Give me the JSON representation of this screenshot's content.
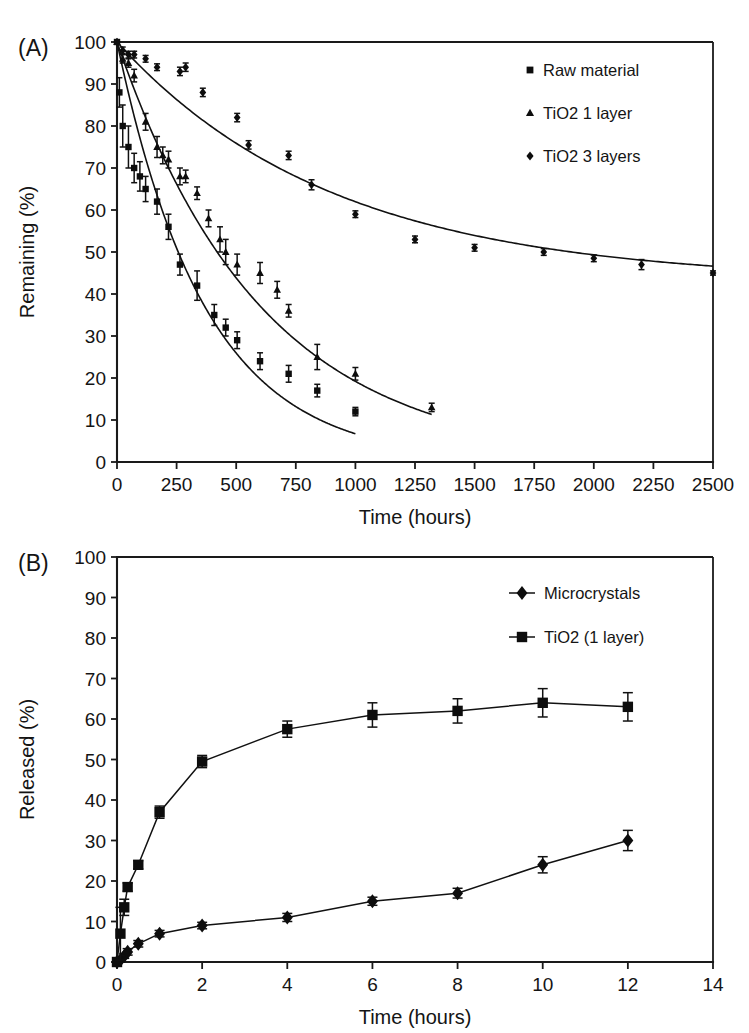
{
  "figure": {
    "background": "#ffffff",
    "ink_color": "#111111"
  },
  "panels": [
    {
      "id": "A",
      "letter": "(A)",
      "xlabel": "Time (hours)",
      "ylabel": "Remaining (%)"
    },
    {
      "id": "B",
      "letter": "(B)",
      "xlabel": "Time (hours)",
      "ylabel": "Released (%)"
    }
  ],
  "chart_data": [
    {
      "id": "panel-a",
      "type": "scatter",
      "title": "",
      "panel_label": "(A)",
      "xlabel": "Time (hours)",
      "ylabel": "Remaining (%)",
      "xlim": [
        0,
        2500
      ],
      "ylim": [
        0,
        100
      ],
      "xticks": [
        0,
        250,
        500,
        750,
        1000,
        1250,
        1500,
        1750,
        2000,
        2250,
        2500
      ],
      "xticklabels": [
        "0",
        "250",
        "500",
        "750",
        "1000",
        "1250",
        "1500",
        "1750",
        "2000",
        "2250",
        "2500"
      ],
      "yticks": [
        0,
        10,
        20,
        30,
        40,
        50,
        60,
        70,
        80,
        90,
        100
      ],
      "yticklabels": [
        "0",
        "10",
        "20",
        "30",
        "40",
        "50",
        "60",
        "70",
        "80",
        "90",
        "100"
      ],
      "grid": false,
      "legend_position": "upper-right",
      "has_fit_curves": true,
      "error_bars": "symmetric-standard-deviation",
      "series": [
        {
          "name": "Raw material",
          "marker": "square",
          "x": [
            0,
            10,
            24,
            48,
            72,
            96,
            120,
            168,
            216,
            264,
            336,
            408,
            456,
            504,
            600,
            720,
            840,
            1000
          ],
          "y": [
            100,
            88,
            80,
            75,
            70,
            68,
            65,
            62,
            56,
            47,
            42,
            35,
            32,
            29,
            24,
            21,
            17,
            12
          ],
          "yerr": [
            0.5,
            3.5,
            5.0,
            5.0,
            3.5,
            3.5,
            3.0,
            3.0,
            3.0,
            2.5,
            3.5,
            2.5,
            2.0,
            2.0,
            2.0,
            2.0,
            1.5,
            1.0
          ],
          "fit": {
            "model": "exponential-decay",
            "y0": 100,
            "plateau": 0,
            "rate_per_hour": 0.0027
          }
        },
        {
          "name": "TiO2 1 layer",
          "marker": "triangle",
          "x": [
            0,
            24,
            48,
            72,
            120,
            168,
            192,
            216,
            264,
            288,
            336,
            384,
            432,
            456,
            504,
            600,
            672,
            720,
            840,
            1000,
            1320
          ],
          "y": [
            100,
            96,
            95,
            92,
            81,
            75,
            73,
            72,
            68,
            68,
            64,
            58,
            53,
            50,
            47,
            45,
            41,
            36,
            25,
            21,
            13
          ],
          "yerr": [
            0.5,
            1.0,
            1.0,
            1.5,
            2.0,
            2.5,
            2.0,
            2.0,
            2.0,
            1.5,
            1.5,
            2.0,
            3.0,
            3.0,
            2.5,
            2.5,
            2.0,
            1.5,
            3.0,
            1.5,
            1.0
          ],
          "fit": {
            "model": "exponential-decay",
            "y0": 100,
            "plateau": 0,
            "rate_per_hour": 0.00165
          }
        },
        {
          "name": "TiO2 3 layers",
          "marker": "diamond",
          "x": [
            0,
            24,
            48,
            72,
            120,
            168,
            264,
            288,
            360,
            504,
            552,
            720,
            816,
            1000,
            1250,
            1500,
            1790,
            2000,
            2200,
            2500
          ],
          "y": [
            100,
            98,
            97,
            97,
            96,
            94,
            93,
            94,
            88,
            82,
            75.5,
            73,
            66,
            59,
            53,
            51,
            50,
            48.5,
            47,
            45
          ],
          "yerr": [
            0.5,
            0.8,
            0.8,
            0.8,
            0.8,
            0.8,
            1.0,
            1.0,
            1.0,
            1.0,
            1.0,
            1.0,
            1.2,
            0.8,
            0.8,
            0.8,
            0.8,
            0.8,
            1.2,
            0.5
          ],
          "fit": {
            "model": "exponential-decay-with-plateau",
            "y0": 100,
            "plateau": 43,
            "rate_per_hour": 0.0011
          }
        }
      ]
    },
    {
      "id": "panel-b",
      "type": "line",
      "title": "",
      "panel_label": "(B)",
      "xlabel": "Time (hours)",
      "ylabel": "Released (%)",
      "xlim": [
        0,
        14
      ],
      "ylim": [
        0,
        100
      ],
      "xticks": [
        0,
        2,
        4,
        6,
        8,
        10,
        12,
        14
      ],
      "xticklabels": [
        "0",
        "2",
        "4",
        "6",
        "8",
        "10",
        "12",
        "14"
      ],
      "yticks": [
        0,
        10,
        20,
        30,
        40,
        50,
        60,
        70,
        80,
        90,
        100
      ],
      "yticklabels": [
        "0",
        "10",
        "20",
        "30",
        "40",
        "50",
        "60",
        "70",
        "80",
        "90",
        "100"
      ],
      "grid": false,
      "legend_position": "upper-right",
      "has_fit_curves": false,
      "error_bars": "symmetric-standard-deviation",
      "series": [
        {
          "name": "Microcrystals",
          "marker": "diamond",
          "x": [
            0,
            0.08,
            0.17,
            0.25,
            0.5,
            1.0,
            2.0,
            4.0,
            6.0,
            8.0,
            10.0,
            12.0
          ],
          "y": [
            0,
            0.5,
            1.5,
            2.5,
            4.5,
            7.0,
            9.0,
            11.0,
            15.0,
            17.0,
            24.0,
            30.0
          ],
          "yerr": [
            0.3,
            0.5,
            0.6,
            0.8,
            0.8,
            0.8,
            0.8,
            1.0,
            1.0,
            1.2,
            2.0,
            2.5
          ]
        },
        {
          "name": "TiO2 (1 layer)",
          "marker": "square",
          "x": [
            0,
            0.08,
            0.17,
            0.25,
            0.5,
            1.0,
            2.0,
            4.0,
            6.0,
            8.0,
            10.0,
            12.0
          ],
          "y": [
            0,
            7.0,
            13.5,
            18.5,
            24.0,
            37.0,
            49.5,
            57.5,
            61.0,
            62.0,
            64.0,
            63.0
          ],
          "yerr": [
            0.5,
            6.5,
            2.0,
            1.0,
            1.0,
            1.5,
            1.5,
            2.0,
            3.0,
            3.0,
            3.5,
            3.5
          ]
        }
      ]
    }
  ],
  "legends": {
    "panel_a": {
      "items": [
        {
          "label": "Raw material",
          "marker": "square",
          "with_line": false
        },
        {
          "label": "TiO2 1 layer",
          "marker": "triangle",
          "with_line": false
        },
        {
          "label": "TiO2 3 layers",
          "marker": "diamond",
          "with_line": false
        }
      ]
    },
    "panel_b": {
      "items": [
        {
          "label": "Microcrystals",
          "marker": "diamond",
          "with_line": true
        },
        {
          "label": "TiO2 (1 layer)",
          "marker": "square",
          "with_line": true
        }
      ]
    }
  }
}
